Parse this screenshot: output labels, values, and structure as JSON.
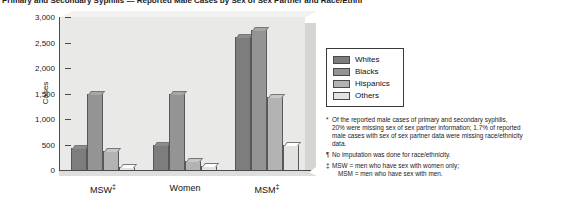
{
  "title": "Primary and Secondary Syphilis — Reported Male Cases by Sex of Sex Partner and Race/Ethnicity",
  "legend": {
    "items": [
      {
        "label": "Whites",
        "color": "#7d7d7d"
      },
      {
        "label": "Blacks",
        "color": "#949494"
      },
      {
        "label": "Hispanics",
        "color": "#b3b3b3"
      },
      {
        "label": "Others",
        "color": "#e2e2e0"
      }
    ]
  },
  "footnotes": [
    {
      "mark": "*",
      "lines": [
        "Of the reported male cases of primary and secondary syphilis,",
        "20% were missing sex of sex partner information; 1.7% of reported",
        "male cases with sex of sex partner data were missing race/ethnicity",
        "data."
      ]
    },
    {
      "mark": "¶",
      "lines": [
        "No imputation was done for race/ethnicity."
      ]
    },
    {
      "mark": "‡",
      "lines": [
        "MSW = men who have sex with women only;",
        "MSM = men who have sex with men."
      ],
      "indent_from": 1
    }
  ],
  "chart_data": {
    "type": "bar",
    "title": "Primary and Secondary Syphilis — Reported Male Cases by Sex of Sex Partner and Race/Ethnicity",
    "xlabel": "",
    "ylabel": "Cases",
    "ylim": [
      0,
      3000
    ],
    "yticks": [
      0,
      500,
      1000,
      1500,
      2000,
      2500,
      3000
    ],
    "ytick_labels": [
      "0",
      "500",
      "1,000",
      "1,500",
      "2,000",
      "2,500",
      "3,000"
    ],
    "categories": [
      "MSW‡",
      "Women",
      "MSM‡"
    ],
    "grid": false,
    "legend_position": "right",
    "series": [
      {
        "name": "Whites",
        "values": [
          430,
          490,
          2600
        ]
      },
      {
        "name": "Blacks",
        "values": [
          1500,
          1500,
          2750
        ]
      },
      {
        "name": "Hispanics",
        "values": [
          370,
          180,
          1440
        ]
      },
      {
        "name": "Others",
        "values": [
          60,
          70,
          490
        ]
      }
    ]
  }
}
